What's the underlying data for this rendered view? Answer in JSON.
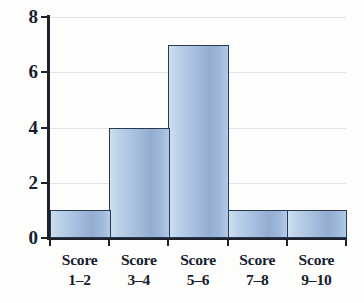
{
  "chart_data": {
    "type": "bar",
    "title": "",
    "subtitle": "",
    "xlabel": "",
    "ylabel": "",
    "categories": [
      "Score 1–2",
      "Score 3–4",
      "Score 5–6",
      "Score 7–8",
      "Score 9–10"
    ],
    "category_lines": [
      {
        "line1": "Score",
        "line2": "1–2"
      },
      {
        "line1": "Score",
        "line2": "3–4"
      },
      {
        "line1": "Score",
        "line2": "5–6"
      },
      {
        "line1": "Score",
        "line2": "7–8"
      },
      {
        "line1": "Score",
        "line2": "9–10"
      }
    ],
    "values": [
      1,
      4,
      7,
      1,
      1
    ],
    "ylim": [
      0,
      8
    ],
    "ytick_values": [
      0,
      2,
      4,
      6,
      8
    ],
    "ytick_labels": [
      "0",
      "2",
      "4",
      "6",
      "8"
    ],
    "grid": true,
    "grid_axis": "y",
    "legend": false,
    "legend_position": "none",
    "annotations": []
  },
  "style": {
    "bar_fill_light": "#cddff0",
    "bar_fill_mid": "#a8c0df",
    "bar_fill_deep": "#93add2",
    "bar_border": "#2b3a52",
    "axis_color": "#1d222c",
    "grid_color": "#dfe3ea",
    "text_color": "#16202f",
    "background": "#fdfdfc"
  }
}
